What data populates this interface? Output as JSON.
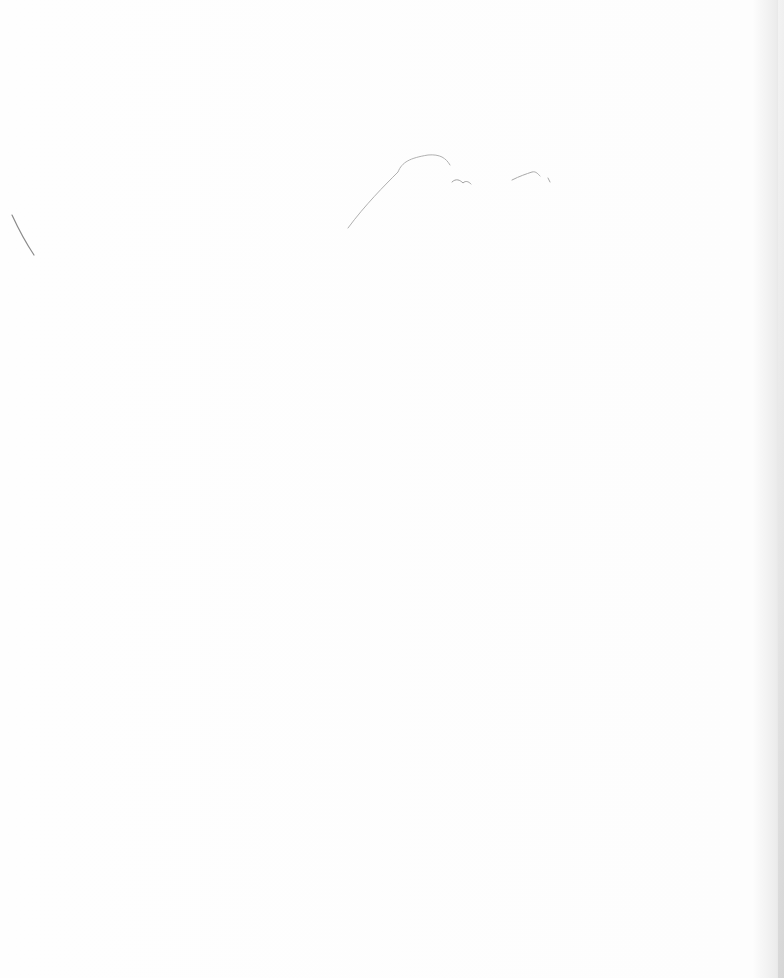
{
  "page": {
    "type": "blank-scanned-sheet",
    "background_color": "#fdfdfd",
    "edge_shadow_color": "#d9d9d9",
    "text": ""
  },
  "marks": [
    {
      "name": "pencil-stroke-left",
      "color": "#8a8a8a"
    },
    {
      "name": "pencil-stroke-top-curve",
      "color": "#b0b0b0"
    },
    {
      "name": "pencil-squiggle-1",
      "color": "#a0a0a0"
    },
    {
      "name": "pencil-squiggle-2",
      "color": "#a8a8a8"
    }
  ]
}
